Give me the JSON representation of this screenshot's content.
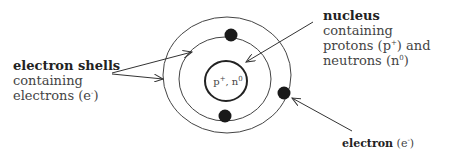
{
  "diagram": {
    "nucleus_label": {
      "bold": "nucleus",
      "line1_rest": " containing",
      "line2": "protons (p",
      "line2_sup": "+",
      "line2_end": ") and",
      "line3": "neutrons (n",
      "line3_sup": "0",
      "line3_end": ")"
    },
    "shells_label": {
      "bold": "electron shells",
      "line2": "containing",
      "line3": "electrons (e",
      "line3_sup": "-",
      "line3_end": ")"
    },
    "electron_label": {
      "bold": "electron",
      "rest": " (e",
      "sup": "-",
      "end": ")"
    },
    "nucleus_text": {
      "p": "p",
      "p_sup": "+",
      "sep": ", n",
      "n_sup": "0"
    },
    "colors": {
      "line": "#333333",
      "electron": "#1a1a1a",
      "text": "#444444"
    }
  }
}
